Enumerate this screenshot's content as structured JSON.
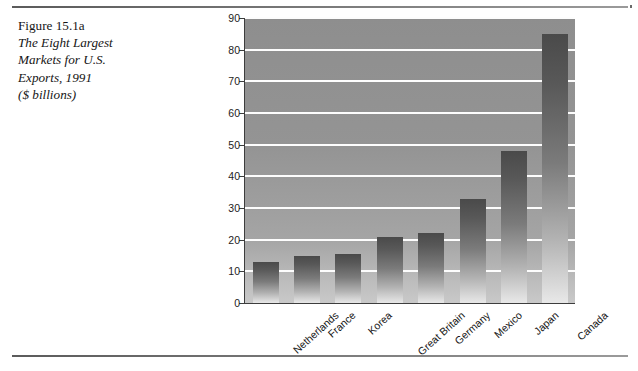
{
  "figure": {
    "caption_lines": [
      {
        "text": "Figure 15.1a",
        "italic": false
      },
      {
        "text": "The Eight Largest",
        "italic": true
      },
      {
        "text": "Markets for U.S.",
        "italic": true
      },
      {
        "text": "Exports, 1991",
        "italic": true
      },
      {
        "text": "($ billions)",
        "italic": true
      }
    ]
  },
  "chart_data": {
    "type": "bar",
    "xlabel": "",
    "ylabel": "",
    "units": "$ billions",
    "categories": [
      "Netherlands",
      "France",
      "Korea",
      "Great Britain",
      "Germany",
      "Mexico",
      "Japan",
      "Canada"
    ],
    "values": [
      13,
      15,
      15.5,
      21,
      22,
      33,
      48,
      85
    ],
    "ylim": [
      0,
      90
    ],
    "yticks": [
      0,
      10,
      20,
      30,
      40,
      50,
      60,
      70,
      80,
      90
    ],
    "ytick_labels": [
      "0",
      "10",
      "20",
      "30",
      "40",
      "50",
      "60",
      "70",
      "80",
      "90"
    ],
    "grid": true,
    "legend": false,
    "colors": {
      "bar_top": "#4a4a4a",
      "bar_bottom": "#e8e8e8",
      "plot_background": "#949494",
      "gridline": "#fdfdfd",
      "axis": "#3d3d3d",
      "page_background": "#ffffff",
      "rule": "#6a6a6a"
    }
  }
}
